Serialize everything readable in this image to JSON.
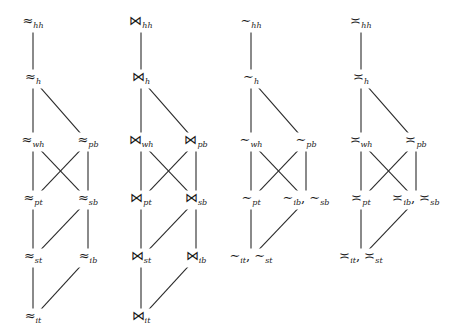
{
  "diagrams": [
    {
      "relation": "approx",
      "symbol": "≈",
      "nodes": [
        {
          "id": "hh",
          "label": [
            "≈",
            "hh"
          ],
          "x": 33,
          "y": 23
        },
        {
          "id": "h",
          "label": [
            "≈",
            "h"
          ],
          "x": 33,
          "y": 79
        },
        {
          "id": "wh",
          "label": [
            "≈",
            "wh"
          ],
          "x": 33,
          "y": 142
        },
        {
          "id": "pb",
          "label": [
            "≈",
            "pb"
          ],
          "x": 88,
          "y": 142
        },
        {
          "id": "pt",
          "label": [
            "≈",
            "pt"
          ],
          "x": 33,
          "y": 200
        },
        {
          "id": "sb",
          "label": [
            "≈",
            "sb"
          ],
          "x": 88,
          "y": 200
        },
        {
          "id": "st",
          "label": [
            "≈",
            "st"
          ],
          "x": 33,
          "y": 258
        },
        {
          "id": "ib",
          "label": [
            "≈",
            "ib"
          ],
          "x": 88,
          "y": 258
        },
        {
          "id": "it",
          "label": [
            "≈",
            "it"
          ],
          "x": 33,
          "y": 318
        }
      ],
      "edges": [
        [
          "hh",
          "h"
        ],
        [
          "h",
          "wh"
        ],
        [
          "h",
          "pb"
        ],
        [
          "wh",
          "pt"
        ],
        [
          "wh",
          "sb"
        ],
        [
          "pb",
          "pt"
        ],
        [
          "pb",
          "sb"
        ],
        [
          "pt",
          "st"
        ],
        [
          "sb",
          "st"
        ],
        [
          "sb",
          "ib"
        ],
        [
          "st",
          "it"
        ],
        [
          "ib",
          "it"
        ]
      ]
    },
    {
      "relation": "bowtie",
      "symbol": "⋈",
      "nodes": [
        {
          "id": "hh",
          "label": [
            "⋈",
            "hh"
          ],
          "x": 141,
          "y": 23
        },
        {
          "id": "h",
          "label": [
            "⋈",
            "h"
          ],
          "x": 141,
          "y": 79
        },
        {
          "id": "wh",
          "label": [
            "⋈",
            "wh"
          ],
          "x": 141,
          "y": 142
        },
        {
          "id": "pb",
          "label": [
            "⋈",
            "pb"
          ],
          "x": 196,
          "y": 142
        },
        {
          "id": "pt",
          "label": [
            "⋈",
            "pt"
          ],
          "x": 141,
          "y": 200
        },
        {
          "id": "sb",
          "label": [
            "⋈",
            "sb"
          ],
          "x": 196,
          "y": 200
        },
        {
          "id": "st",
          "label": [
            "⋈",
            "st"
          ],
          "x": 141,
          "y": 258
        },
        {
          "id": "ib",
          "label": [
            "⋈",
            "ib"
          ],
          "x": 196,
          "y": 258
        },
        {
          "id": "it",
          "label": [
            "⋈",
            "it"
          ],
          "x": 141,
          "y": 318
        }
      ],
      "edges": [
        [
          "hh",
          "h"
        ],
        [
          "h",
          "wh"
        ],
        [
          "h",
          "pb"
        ],
        [
          "wh",
          "pt"
        ],
        [
          "wh",
          "sb"
        ],
        [
          "pb",
          "pt"
        ],
        [
          "pb",
          "sb"
        ],
        [
          "pt",
          "st"
        ],
        [
          "sb",
          "st"
        ],
        [
          "sb",
          "ib"
        ],
        [
          "st",
          "it"
        ],
        [
          "ib",
          "it"
        ]
      ]
    },
    {
      "relation": "sim",
      "symbol": "∼",
      "nodes": [
        {
          "id": "hh",
          "label": [
            "∼",
            "hh"
          ],
          "x": 251,
          "y": 23
        },
        {
          "id": "h",
          "label": [
            "∼",
            "h"
          ],
          "x": 251,
          "y": 79
        },
        {
          "id": "wh",
          "label": [
            "∼",
            "wh"
          ],
          "x": 251,
          "y": 142
        },
        {
          "id": "pb",
          "label": [
            "∼",
            "pb"
          ],
          "x": 306,
          "y": 142
        },
        {
          "id": "pt",
          "label": [
            "∼",
            "pt"
          ],
          "x": 251,
          "y": 200
        },
        {
          "id": "ibsb",
          "label": [
            "∼",
            "ib",
            ", ∼",
            "sb"
          ],
          "x": 306,
          "y": 200
        },
        {
          "id": "itst",
          "label": [
            "∼",
            "it",
            ", ∼",
            "st"
          ],
          "x": 251,
          "y": 258
        }
      ],
      "edges": [
        [
          "hh",
          "h"
        ],
        [
          "h",
          "wh"
        ],
        [
          "h",
          "pb"
        ],
        [
          "wh",
          "pt"
        ],
        [
          "wh",
          "ibsb"
        ],
        [
          "pb",
          "pt"
        ],
        [
          "pb",
          "ibsb"
        ],
        [
          "pt",
          "itst"
        ],
        [
          "ibsb",
          "itst"
        ]
      ]
    },
    {
      "relation": "asymp",
      "symbol": "≍",
      "nodes": [
        {
          "id": "hh",
          "label": [
            "≍",
            "hh"
          ],
          "x": 361,
          "y": 23
        },
        {
          "id": "h",
          "label": [
            "≍",
            "h"
          ],
          "x": 361,
          "y": 79
        },
        {
          "id": "wh",
          "label": [
            "≍",
            "wh"
          ],
          "x": 361,
          "y": 142
        },
        {
          "id": "pb",
          "label": [
            "≍",
            "pb"
          ],
          "x": 416,
          "y": 142
        },
        {
          "id": "pt",
          "label": [
            "≍",
            "pt"
          ],
          "x": 361,
          "y": 200
        },
        {
          "id": "ibsb",
          "label": [
            "≍",
            "ib",
            ", ≍",
            "sb"
          ],
          "x": 416,
          "y": 200
        },
        {
          "id": "itst",
          "label": [
            "≍",
            "it",
            ", ≍",
            "st"
          ],
          "x": 361,
          "y": 258
        }
      ],
      "edges": [
        [
          "hh",
          "h"
        ],
        [
          "h",
          "wh"
        ],
        [
          "h",
          "pb"
        ],
        [
          "wh",
          "pt"
        ],
        [
          "wh",
          "ibsb"
        ],
        [
          "pb",
          "pt"
        ],
        [
          "pb",
          "ibsb"
        ],
        [
          "pt",
          "itst"
        ],
        [
          "ibsb",
          "itst"
        ]
      ]
    }
  ]
}
